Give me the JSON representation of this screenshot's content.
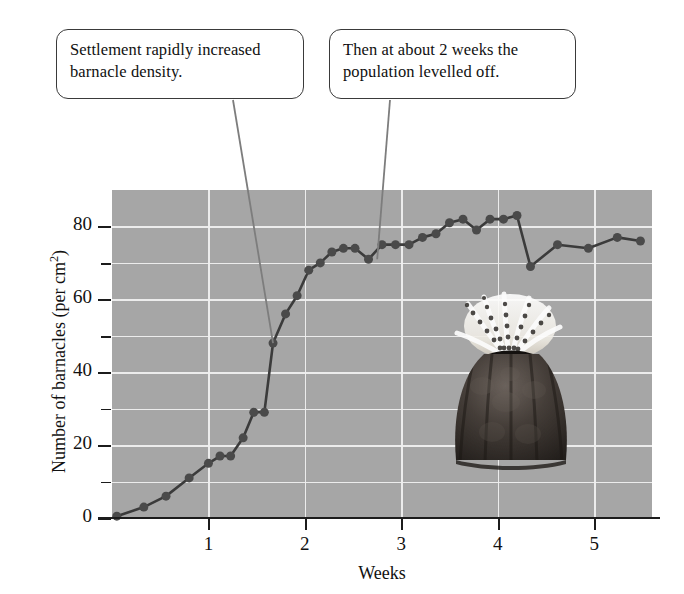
{
  "figure": {
    "callouts": [
      {
        "name": "settlement",
        "line1": "Settlement rapidly increased",
        "line2": "barnacle density."
      },
      {
        "name": "levelled",
        "line1": "Then at about 2 weeks the",
        "line2": "population levelled off."
      }
    ],
    "barnacle_caption": "barnacle-photograph"
  },
  "chart_data": {
    "type": "line",
    "title": "",
    "xlabel": "Weeks",
    "ylabel_text": "Number of barnacles (per cm",
    "ylabel_sup": "2",
    "ylabel_tail": ")",
    "xlim": [
      0,
      5.6
    ],
    "ylim": [
      0,
      90
    ],
    "xticks": [
      1,
      2,
      3,
      4,
      5
    ],
    "xtick_labels": [
      "1",
      "2",
      "3",
      "4",
      "5"
    ],
    "yticks": [
      0,
      20,
      40,
      60,
      80
    ],
    "ytick_labels": [
      "0",
      "20",
      "40",
      "60",
      "80"
    ],
    "yticks_minor": [
      10,
      30,
      50,
      70
    ],
    "grid": true,
    "grid_color": "#efefef",
    "plot_background": "#a9a9a9",
    "marker_color": "#4a4a4a",
    "line_color": "#3b3b3b",
    "marker_size": 9,
    "series": [
      {
        "name": "Barnacle density",
        "x": [
          0.05,
          0.33,
          0.56,
          0.8,
          1.0,
          1.12,
          1.23,
          1.36,
          1.47,
          1.58,
          1.67,
          1.8,
          1.92,
          2.04,
          2.16,
          2.28,
          2.4,
          2.52,
          2.66,
          2.8,
          2.94,
          3.08,
          3.22,
          3.36,
          3.5,
          3.64,
          3.78,
          3.92,
          4.06,
          4.2,
          4.34,
          4.62,
          4.94,
          5.24,
          5.48
        ],
        "y": [
          0.5,
          3,
          6,
          11,
          15,
          17,
          17,
          22,
          29,
          29,
          48,
          56,
          61,
          68,
          70,
          73,
          74,
          74,
          71,
          75,
          75,
          75,
          77,
          78,
          81,
          82,
          79,
          82,
          82,
          83,
          69,
          75,
          74,
          77,
          76
        ]
      }
    ],
    "annotations": [
      {
        "name": "settlement-leader",
        "text": "Settlement rapidly increased barnacle density.",
        "points_to_x": 1.67,
        "points_to_y": 48
      },
      {
        "name": "levelled-leader",
        "text": "Then at about 2 weeks the population levelled off.",
        "points_to_x": 2.75,
        "points_to_y": 71
      }
    ]
  }
}
